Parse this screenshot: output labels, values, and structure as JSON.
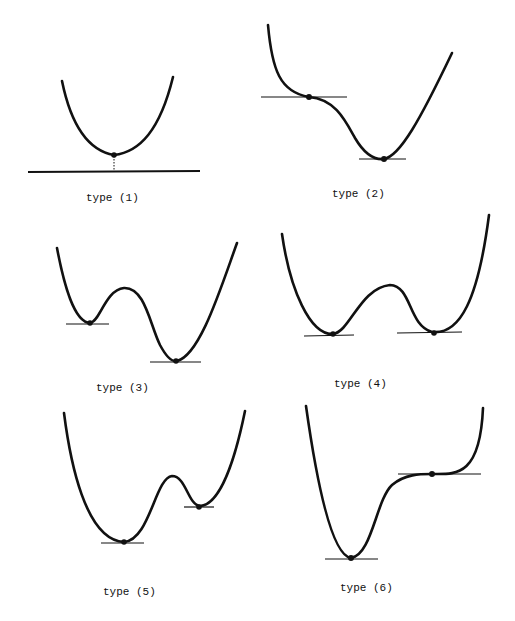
{
  "figure": {
    "colors": {
      "ink": "#111111",
      "background": "#ffffff"
    },
    "panels": [
      {
        "id": 1,
        "label": "type (1)",
        "features": [
          "single minimum",
          "horizontal axis",
          "dotted drop line from minimum to axis"
        ]
      },
      {
        "id": 2,
        "label": "type (2)",
        "features": [
          "inflection point with horizontal tangent",
          "global minimum with horizontal tangent"
        ]
      },
      {
        "id": 3,
        "label": "type (3)",
        "features": [
          "local minimum (higher, left)",
          "global minimum (lower, right)"
        ]
      },
      {
        "id": 4,
        "label": "type (4)",
        "features": [
          "two equal minima",
          "central barrier"
        ]
      },
      {
        "id": 5,
        "label": "type (5)",
        "features": [
          "global minimum (lower, left)",
          "local minimum (higher, right)"
        ]
      },
      {
        "id": 6,
        "label": "type (6)",
        "features": [
          "global minimum (left)",
          "inflection point with horizontal tangent (right, higher)"
        ]
      }
    ]
  }
}
